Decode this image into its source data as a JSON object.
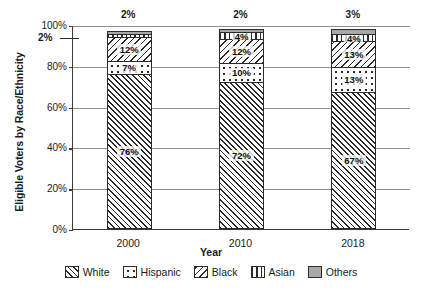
{
  "chart_data": {
    "type": "bar",
    "subtype": "100% stacked column",
    "title": "",
    "xlabel": "Year",
    "ylabel": "Eligible Voters by Race/Ethnicity",
    "categories": [
      "2000",
      "2010",
      "2018"
    ],
    "ylim": [
      0,
      100
    ],
    "ytick_labels": [
      "0%",
      "20%",
      "40%",
      "60%",
      "80%",
      "100%"
    ],
    "ytick_values": [
      0,
      20,
      40,
      60,
      80,
      100
    ],
    "grid": true,
    "legend_position": "bottom",
    "series": [
      {
        "name": "White",
        "pattern": "diagonal-hatch-forward",
        "values": [
          76,
          72,
          67
        ],
        "labels": [
          "76%",
          "72%",
          "67%"
        ]
      },
      {
        "name": "Hispanic",
        "pattern": "dotted",
        "values": [
          7,
          10,
          13
        ],
        "labels": [
          "7%",
          "10%",
          "13%"
        ]
      },
      {
        "name": "Black",
        "pattern": "diagonal-hatch-backward",
        "values": [
          12,
          12,
          13
        ],
        "labels": [
          "12%",
          "12%",
          "13%"
        ]
      },
      {
        "name": "Asian",
        "pattern": "vertical-stripes",
        "values": [
          2,
          4,
          4
        ],
        "labels": [
          "2%",
          "4%",
          "4%"
        ]
      },
      {
        "name": "Others",
        "pattern": "solid-gray",
        "values": [
          2,
          2,
          3
        ],
        "labels": [
          "2%",
          "2%",
          "3%"
        ]
      }
    ],
    "annotations": [
      {
        "text": "2%",
        "describes": "Asian segment of the 2000 bar",
        "placement": "outside-left-with-leader-line"
      },
      {
        "text": "2%",
        "describes": "Others segment of the 2000 bar",
        "placement": "above-bar"
      },
      {
        "text": "2%",
        "describes": "Others segment of the 2010 bar",
        "placement": "above-bar"
      },
      {
        "text": "3%",
        "describes": "Others segment of the 2018 bar",
        "placement": "above-bar"
      }
    ]
  },
  "legend": {
    "items": [
      {
        "label": "White"
      },
      {
        "label": "Hispanic"
      },
      {
        "label": "Black"
      },
      {
        "label": "Asian"
      },
      {
        "label": "Others"
      }
    ]
  },
  "colors": {
    "ink": "#2b2b2b",
    "grid": "#8e8e8e",
    "others_fill": "#a8a8a8",
    "background": "#ffffff"
  }
}
